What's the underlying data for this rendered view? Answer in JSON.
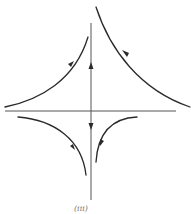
{
  "figure": {
    "type": "phase-portrait",
    "caption": "(iii)",
    "colors": {
      "curve": "#2a2a2a",
      "axis": "#555555",
      "background": "#ffffff"
    }
  },
  "axes": {
    "horizontal": {
      "x1": 5,
      "x2": 176,
      "y": 111
    },
    "vertical": {
      "x": 91,
      "y1": 23,
      "y2": 200,
      "arrows": [
        "up-above-origin",
        "down-below-origin"
      ]
    }
  },
  "trajectories": [
    {
      "id": "upper-left",
      "direction": "toward vertical axis, upward"
    },
    {
      "id": "upper-right",
      "direction": "toward vertical axis, upward-left"
    },
    {
      "id": "lower-left",
      "direction": "downward toward vertical axis"
    },
    {
      "id": "lower-right",
      "direction": "downward"
    }
  ]
}
